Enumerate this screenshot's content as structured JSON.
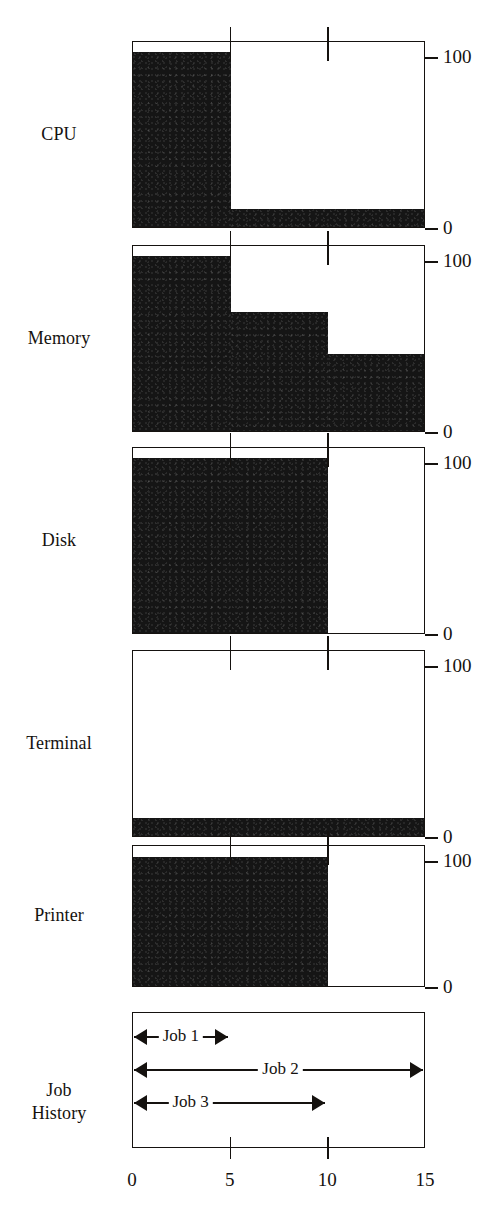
{
  "figure": {
    "row_labels": [
      "CPU",
      "Memory",
      "Disk",
      "Terminal",
      "Printer"
    ],
    "job_history_label_line1": "Job",
    "job_history_label_line2": "History"
  },
  "chart_data": {
    "type": "bar",
    "title": "",
    "xlabel": "",
    "ylabel": "",
    "xlim": [
      0,
      15
    ],
    "ylim": [
      0,
      100
    ],
    "x_ticks": [
      0,
      5,
      10,
      15
    ],
    "x_tick_labels": [
      "0",
      "5",
      "10",
      "15"
    ],
    "y_ticks": [
      0,
      100
    ],
    "y_tick_labels": [
      "0",
      "100"
    ],
    "grid": false,
    "legend": "none",
    "bar_color": "#151515",
    "axis_color": "#15120f",
    "panels": [
      {
        "name": "CPU",
        "label": "CPU",
        "y_tick_labels": [
          "100",
          "0"
        ],
        "steps": [
          {
            "x_start": 0,
            "x_end": 5,
            "value": 95
          },
          {
            "x_start": 5,
            "x_end": 15,
            "value": 10
          }
        ]
      },
      {
        "name": "Memory",
        "label": "Memory",
        "y_tick_labels": [
          "100",
          "0"
        ],
        "steps": [
          {
            "x_start": 0,
            "x_end": 5,
            "value": 95
          },
          {
            "x_start": 5,
            "x_end": 10,
            "value": 65
          },
          {
            "x_start": 10,
            "x_end": 15,
            "value": 42
          }
        ]
      },
      {
        "name": "Disk",
        "label": "Disk",
        "y_tick_labels": [
          "100",
          "0"
        ],
        "steps": [
          {
            "x_start": 0,
            "x_end": 10,
            "value": 95
          },
          {
            "x_start": 10,
            "x_end": 15,
            "value": 0
          }
        ]
      },
      {
        "name": "Terminal",
        "label": "Terminal",
        "y_tick_labels": [
          "100",
          "0"
        ],
        "steps": [
          {
            "x_start": 0,
            "x_end": 15,
            "value": 10
          }
        ]
      },
      {
        "name": "Printer",
        "label": "Printer",
        "y_tick_labels": [
          "100",
          "0"
        ],
        "steps": [
          {
            "x_start": 0,
            "x_end": 10,
            "value": 93
          },
          {
            "x_start": 10,
            "x_end": 15,
            "value": 0
          }
        ]
      }
    ],
    "job_history": {
      "label_line1": "Job",
      "label_line2": "History",
      "jobs": [
        {
          "label": "Job 1",
          "x_start": 0,
          "x_end": 5,
          "label_x": 2.5
        },
        {
          "label": "Job 2",
          "x_start": 0,
          "x_end": 15,
          "label_x": 7.6
        },
        {
          "label": "Job 3",
          "x_start": 0,
          "x_end": 10,
          "label_x": 3.0
        }
      ]
    }
  }
}
